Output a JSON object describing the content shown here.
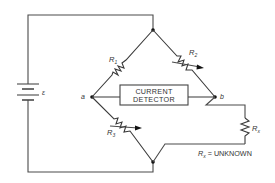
{
  "diagram": {
    "battery": {
      "label": "ε"
    },
    "nodes": {
      "a": "a",
      "b": "b"
    },
    "resistors": {
      "r1": {
        "label": "R",
        "sub": "1"
      },
      "r2": {
        "label": "R",
        "sub": "2"
      },
      "r3": {
        "label": "R",
        "sub": "3"
      },
      "rx": {
        "label": "R",
        "sub": "x"
      }
    },
    "detector": {
      "line1": "CURRENT",
      "line2": "DETECTOR"
    },
    "note": {
      "label": "R",
      "sub": "x",
      "text": " = UNKNOWN"
    },
    "colors": {
      "wire": "#4a4a4a",
      "node": "#111111",
      "text": "#333333"
    }
  }
}
